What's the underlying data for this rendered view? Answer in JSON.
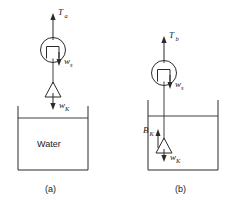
{
  "figure": {
    "background_color": "#ffffff",
    "line_color": "#2b2b2b"
  },
  "panels": [
    {
      "id": "a",
      "caption": "(a)",
      "description": "Weight hanging in air above a container of water",
      "container_label": "Water",
      "forces": [
        {
          "name": "tension",
          "symbol": "T",
          "subscript": "a",
          "direction": "up"
        },
        {
          "name": "scale-weight",
          "symbol": "w",
          "subscript": "s",
          "direction": "down"
        },
        {
          "name": "block-weight",
          "symbol": "w",
          "subscript": "K",
          "direction": "down"
        }
      ]
    },
    {
      "id": "b",
      "caption": "(b)",
      "description": "Weight submerged in water showing buoyant force",
      "container_label": "",
      "forces": [
        {
          "name": "tension",
          "symbol": "T",
          "subscript": "b",
          "direction": "up"
        },
        {
          "name": "scale-weight",
          "symbol": "w",
          "subscript": "s",
          "direction": "down"
        },
        {
          "name": "buoyant-force",
          "symbol": "B",
          "subscript": "K",
          "direction": "up"
        },
        {
          "name": "block-weight",
          "symbol": "w",
          "subscript": "K",
          "direction": "down"
        }
      ]
    }
  ],
  "labels": {
    "panel_a": {
      "tension": "T",
      "tension_sub": "a",
      "scale_weight": "w",
      "scale_weight_sub": "s",
      "block_weight": "w",
      "block_weight_sub": "K",
      "water": "Water",
      "caption": "(a)"
    },
    "panel_b": {
      "tension": "T",
      "tension_sub": "b",
      "scale_weight": "w",
      "scale_weight_sub": "s",
      "buoyancy": "B",
      "buoyancy_sub": "K",
      "block_weight": "w",
      "block_weight_sub": "K",
      "caption": "(b)"
    }
  }
}
